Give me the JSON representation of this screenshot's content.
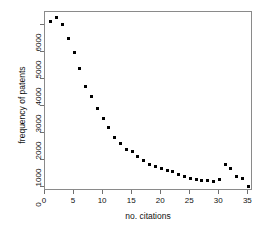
{
  "chart_data": {
    "type": "scatter",
    "title": "",
    "xlabel": "no. citations",
    "ylabel": "frequency of patents",
    "xlim": [
      0,
      35.8
    ],
    "ylim": [
      -150,
      6500
    ],
    "grid": false,
    "legend": null,
    "xticks": [
      0,
      5,
      10,
      15,
      20,
      25,
      30,
      35
    ],
    "xticklabels": [
      "0",
      "5",
      "10",
      "15",
      "20",
      "25",
      "30",
      "35"
    ],
    "yticks": [
      0,
      1000,
      2000,
      3000,
      4000,
      5000,
      6000
    ],
    "yticklabels": [
      "0",
      "1000",
      "2000",
      "3000",
      "4000",
      "5000",
      "6000"
    ],
    "marker": "filled-square",
    "marker_color": "#000000",
    "x": [
      1,
      2,
      3,
      4,
      5,
      6,
      7,
      8,
      9,
      10,
      11,
      12,
      13,
      14,
      15,
      16,
      17,
      18,
      19,
      20,
      21,
      22,
      23,
      24,
      25,
      26,
      27,
      28,
      29,
      30,
      31,
      32,
      33,
      34,
      35
    ],
    "values": [
      6150,
      6300,
      6050,
      5500,
      5000,
      4400,
      3750,
      3350,
      2900,
      2550,
      2200,
      1850,
      1600,
      1400,
      1300,
      1150,
      1000,
      850,
      750,
      680,
      620,
      580,
      470,
      380,
      330,
      290,
      230,
      230,
      190,
      260,
      850,
      690,
      380,
      300,
      20
    ]
  },
  "axis_titles": {
    "x": "no. citations",
    "y": "frequency of patents"
  }
}
